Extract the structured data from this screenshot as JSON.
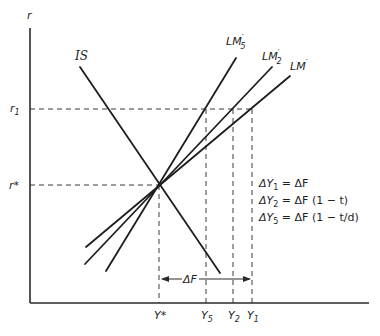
{
  "diagram": {
    "type": "IS-LM shift diagram",
    "axes": {
      "y_label": "r",
      "x_axis": {
        "x1": 30,
        "x2": 369,
        "y": 303
      },
      "y_axis": {
        "x": 30,
        "y1": 28,
        "y2": 303
      }
    },
    "levels": {
      "r1": {
        "label": "r",
        "sub": "1",
        "y": 109
      },
      "r_star": {
        "label": "r*",
        "y": 185
      }
    },
    "equilibrium": {
      "x": 159,
      "y": 185
    },
    "curves": [
      {
        "id": "IS",
        "label": "IS",
        "x1": 80,
        "y1": 67,
        "x2": 220,
        "y2": 273,
        "label_x": 75,
        "label_y": 60
      },
      {
        "id": "LM5",
        "label": "LM",
        "prime": "′",
        "sub": "5",
        "x1": 106,
        "y1": 271,
        "x2": 236,
        "y2": 58,
        "label_x": 226,
        "label_y": 45
      },
      {
        "id": "LM2",
        "label": "LM",
        "prime": "′",
        "sub": "2",
        "x1": 85,
        "y1": 264,
        "x2": 272,
        "y2": 67,
        "label_x": 262,
        "label_y": 60
      },
      {
        "id": "LM1",
        "label": "LM",
        "prime": "′",
        "sub": "",
        "x1": 86,
        "y1": 247,
        "x2": 290,
        "y2": 76,
        "label_x": 290,
        "label_y": 70
      }
    ],
    "x_ticks": [
      {
        "label": "Y*",
        "sub": "",
        "x": 159
      },
      {
        "label": "Y",
        "sub": "5",
        "x": 206
      },
      {
        "label": "Y",
        "sub": "2",
        "x": 233
      },
      {
        "label": "Y",
        "sub": "1",
        "x": 252
      }
    ],
    "delta_f_arrow": {
      "label": "ΔF",
      "x1": 162,
      "x2": 250,
      "y": 279
    },
    "equations": [
      {
        "lhs": "ΔY",
        "sub": "1",
        "rhs": " = ΔF"
      },
      {
        "lhs": "ΔY",
        "sub": "2",
        "rhs": " = ΔF (1 − t)"
      },
      {
        "lhs": "ΔY",
        "sub": "5",
        "rhs": " = ΔF (1 − t/d)"
      }
    ]
  },
  "chart_data": {
    "type": "line",
    "title": "",
    "xlabel": "Y (output)",
    "ylabel": "r",
    "series": [
      {
        "name": "IS",
        "points": [
          [
            80,
            67
          ],
          [
            220,
            273
          ]
        ]
      },
      {
        "name": "LM'5",
        "points": [
          [
            106,
            271
          ],
          [
            236,
            58
          ]
        ]
      },
      {
        "name": "LM'2",
        "points": [
          [
            85,
            264
          ],
          [
            272,
            67
          ]
        ]
      },
      {
        "name": "LM'",
        "points": [
          [
            86,
            247
          ],
          [
            290,
            76
          ]
        ]
      }
    ],
    "annotations": [
      "r1",
      "r*",
      "Y*",
      "Y5",
      "Y2",
      "Y1",
      "ΔF",
      "ΔY1 = ΔF",
      "ΔY2 = ΔF(1 − t)",
      "ΔY5 = ΔF(1 − t/d)"
    ],
    "grid": false
  }
}
